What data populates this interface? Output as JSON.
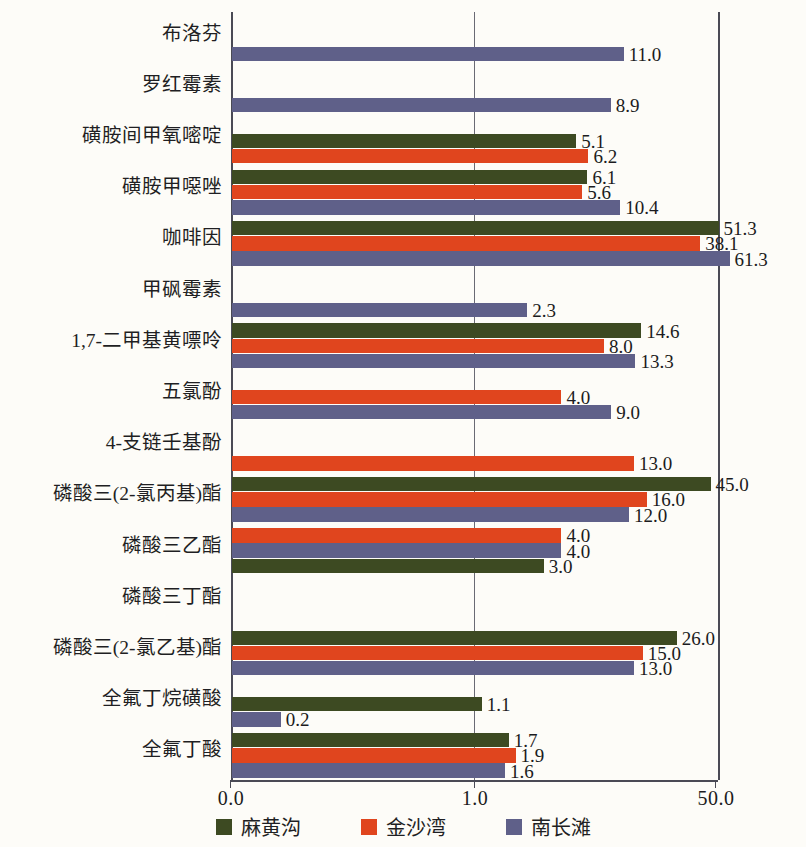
{
  "chart_data": {
    "type": "bar",
    "orientation": "horizontal",
    "title": "",
    "xlabel": "",
    "ylabel": "",
    "grid": true,
    "legend_position": "bottom",
    "x_ticks": [
      "0.0",
      "1.0",
      "50.0"
    ],
    "x_tick_values": [
      0.0,
      1.0,
      50.0
    ],
    "xlim": [
      0.0,
      70.0
    ],
    "series": [
      {
        "name": "麻黄沟",
        "color": "#3d4a22"
      },
      {
        "name": "金沙湾",
        "color": "#e0451e"
      },
      {
        "name": "南长滩",
        "color": "#5f6089"
      }
    ],
    "categories": [
      "布洛芬",
      "罗红霉素",
      "磺胺间甲氧嘧啶",
      "磺胺甲噁唑",
      "咖啡因",
      "甲砜霉素",
      "1,7-二甲基黄嘌呤",
      "五氯酚",
      "4-支链壬基酚",
      "磷酸三(2-氯丙基)酯",
      "磷酸三乙酯",
      "磷酸三丁酯",
      "磷酸三(2-氯乙基)酯",
      "全氟丁烷磺酸",
      "全氟丁酸"
    ],
    "groups": [
      {
        "category": "布洛芬",
        "bars": [
          {
            "series": "南长滩",
            "value": 11.0,
            "label": "11.0"
          }
        ]
      },
      {
        "category": "罗红霉素",
        "bars": [
          {
            "series": "南长滩",
            "value": 8.9,
            "label": "8.9"
          }
        ]
      },
      {
        "category": "磺胺间甲氧嘧啶",
        "bars": [
          {
            "series": "麻黄沟",
            "value": 5.1,
            "label": "5.1"
          },
          {
            "series": "金沙湾",
            "value": 6.2,
            "label": "6.2"
          }
        ]
      },
      {
        "category": "磺胺甲噁唑",
        "bars": [
          {
            "series": "麻黄沟",
            "value": 6.1,
            "label": "6.1"
          },
          {
            "series": "金沙湾",
            "value": 5.6,
            "label": "5.6"
          },
          {
            "series": "南长滩",
            "value": 10.4,
            "label": "10.4"
          }
        ]
      },
      {
        "category": "咖啡因",
        "bars": [
          {
            "series": "麻黄沟",
            "value": 51.3,
            "label": "51.3"
          },
          {
            "series": "金沙湾",
            "value": 38.1,
            "label": "38.1"
          },
          {
            "series": "南长滩",
            "value": 61.3,
            "label": "61.3"
          }
        ]
      },
      {
        "category": "甲砜霉素",
        "bars": [
          {
            "series": "南长滩",
            "value": 2.3,
            "label": "2.3"
          }
        ]
      },
      {
        "category": "1,7-二甲基黄嘌呤",
        "bars": [
          {
            "series": "麻黄沟",
            "value": 14.6,
            "label": "14.6"
          },
          {
            "series": "金沙湾",
            "value": 8.0,
            "label": "8.0"
          },
          {
            "series": "南长滩",
            "value": 13.3,
            "label": "13.3"
          }
        ]
      },
      {
        "category": "五氯酚",
        "bars": [
          {
            "series": "金沙湾",
            "value": 4.0,
            "label": "4.0"
          },
          {
            "series": "南长滩",
            "value": 9.0,
            "label": "9.0"
          }
        ]
      },
      {
        "category": "4-支链壬基酚",
        "bars": [
          {
            "series": "金沙湾",
            "value": 13.0,
            "label": "13.0"
          }
        ]
      },
      {
        "category": "磷酸三(2-氯丙基)酯",
        "bars": [
          {
            "series": "麻黄沟",
            "value": 45.0,
            "label": "45.0"
          },
          {
            "series": "金沙湾",
            "value": 16.0,
            "label": "16.0"
          },
          {
            "series": "南长滩",
            "value": 12.0,
            "label": "12.0"
          }
        ]
      },
      {
        "category": "磷酸三乙酯",
        "bars": [
          {
            "series": "金沙湾",
            "value": 4.0,
            "label": "4.0"
          },
          {
            "series": "南长滩",
            "value": 4.0,
            "label": "4.0"
          },
          {
            "series": "麻黄沟",
            "value": 3.0,
            "label": "3.0"
          }
        ]
      },
      {
        "category": "磷酸三丁酯",
        "bars": []
      },
      {
        "category": "磷酸三(2-氯乙基)酯",
        "bars": [
          {
            "series": "麻黄沟",
            "value": 26.0,
            "label": "26.0"
          },
          {
            "series": "金沙湾",
            "value": 15.0,
            "label": "15.0"
          },
          {
            "series": "南长滩",
            "value": 13.0,
            "label": "13.0"
          }
        ]
      },
      {
        "category": "全氟丁烷磺酸",
        "bars": [
          {
            "series": "麻黄沟",
            "value": 1.1,
            "label": "1.1"
          },
          {
            "series": "南长滩",
            "value": 0.2,
            "label": "0.2"
          }
        ]
      },
      {
        "category": "全氟丁酸",
        "bars": [
          {
            "series": "麻黄沟",
            "value": 1.7,
            "label": "1.7"
          },
          {
            "series": "金沙湾",
            "value": 1.9,
            "label": "1.9"
          },
          {
            "series": "南长滩",
            "value": 1.6,
            "label": "1.6"
          }
        ]
      }
    ]
  },
  "legend": {
    "items": [
      {
        "label": "麻黄沟",
        "color": "#3d4a22"
      },
      {
        "label": "金沙湾",
        "color": "#e0451e"
      },
      {
        "label": "南长滩",
        "color": "#5f6089"
      }
    ]
  },
  "axis": {
    "colors": {
      "line": "#4a4a55",
      "grid": "#6a6a74"
    }
  }
}
